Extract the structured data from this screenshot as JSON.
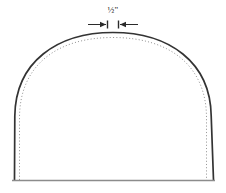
{
  "diagram": {
    "background_color": "#ffffff",
    "annotation": {
      "dimension_label": "½\"",
      "dimension_value": "1/2",
      "dimension_unit": "inch",
      "meaning": "seam allowance",
      "leader_left_x": 95,
      "leader_right_x": 132,
      "leader_y": 24,
      "gap_center_x": 113
    },
    "lines": {
      "cutting_line": {
        "name": "cutting-line",
        "style": "solid",
        "color": "#333333",
        "width": 1.6
      },
      "seam_line": {
        "name": "seam-line",
        "style": "dotted",
        "color": "#9a9a9a",
        "width": 1
      },
      "baseline": {
        "name": "bottom-edge-line",
        "style": "solid",
        "color": "#8c8c8c",
        "width": 1.4,
        "x1": 12,
        "x2": 215,
        "y": 180
      }
    },
    "shape": {
      "type": "dome",
      "left_x": 14,
      "right_x": 214,
      "top_y": 32,
      "bottom_y": 180,
      "seam_offset_px": 5
    }
  }
}
